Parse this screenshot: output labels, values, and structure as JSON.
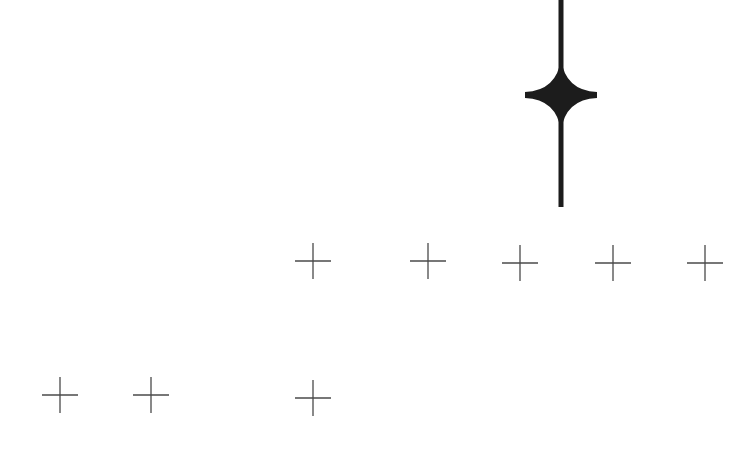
{
  "canvas": {
    "width": 752,
    "height": 471,
    "background": "#ffffff"
  },
  "colors": {
    "star": "#1c1c1c",
    "cross": "#4a4a4a"
  },
  "star_marker": {
    "icon": "four-point-star-icon",
    "center_x": 561,
    "center_y": 95,
    "half_width": 36,
    "half_height": 36,
    "stem_top": 0,
    "stem_bottom": 207,
    "stem_width": 5
  },
  "crosses": {
    "icon": "plus-cross-icon",
    "half_size": 18,
    "stroke_width": 1.3,
    "rows": [
      {
        "name": "upper-row",
        "points": [
          {
            "x": 313,
            "y": 261
          },
          {
            "x": 428,
            "y": 261
          },
          {
            "x": 520,
            "y": 263
          },
          {
            "x": 613,
            "y": 263
          },
          {
            "x": 705,
            "y": 263
          }
        ]
      },
      {
        "name": "lower-row",
        "points": [
          {
            "x": 60,
            "y": 395
          },
          {
            "x": 151,
            "y": 395
          },
          {
            "x": 313,
            "y": 398
          }
        ]
      }
    ]
  }
}
